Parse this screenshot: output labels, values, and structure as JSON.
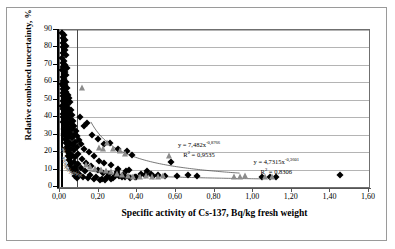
{
  "chart_data": {
    "type": "scatter",
    "title": "",
    "xlabel": "Specific activity of Cs-137, Bq/kg fresh weight",
    "ylabel": "Relative combined uncertainty, %",
    "xlim": [
      0.0,
      1.6
    ],
    "ylim": [
      0,
      90
    ],
    "xticks": [
      "0,00",
      "0,20",
      "0,40",
      "0,60",
      "0,80",
      "1,00",
      "1,20",
      "1,40",
      "1,60"
    ],
    "xtick_values": [
      0.0,
      0.2,
      0.4,
      0.6,
      0.8,
      1.0,
      1.2,
      1.4,
      1.6
    ],
    "yticks": [
      "0",
      "10",
      "20",
      "30",
      "40",
      "50",
      "60",
      "70",
      "80",
      "90"
    ],
    "ytick_values": [
      0,
      10,
      20,
      30,
      40,
      50,
      60,
      70,
      80,
      90
    ],
    "grid": "horizontal-only",
    "legend": "none",
    "reference_lines": [
      {
        "name": "detection-limit-line-1",
        "x": 0.007
      },
      {
        "name": "detection-limit-line-2",
        "x": 0.088
      }
    ],
    "annotations": [
      {
        "name": "trend-equation-upper",
        "equation": "y = 7,482x",
        "exponent": "-0,8766",
        "r2": "R",
        "r2_sup": "2",
        "r2_value": " = 0,9535",
        "x": 0.72,
        "y": 22
      },
      {
        "name": "trend-equation-lower",
        "equation": "y = 4,7315x",
        "exponent": "-0,3601",
        "r2": "R",
        "r2_sup": "2",
        "r2_value": " = 0,8306",
        "x": 1.12,
        "y": 12
      }
    ],
    "trendlines": [
      {
        "name": "power-fit-upper",
        "coefficient": 7.482,
        "exponent": -0.8766,
        "r2": 0.9535,
        "x_start": 0.16,
        "x_end": 0.93
      },
      {
        "name": "power-fit-lower",
        "coefficient": 4.7315,
        "exponent": -0.3601,
        "r2": 0.8306,
        "x_start": 0.1,
        "x_end": 1.05
      }
    ],
    "series": [
      {
        "name": "diamond-series",
        "marker": "diamond",
        "color": "#000000",
        "points": [
          [
            0.012,
            88.5
          ],
          [
            0.021,
            87.0
          ],
          [
            0.015,
            85.5
          ],
          [
            0.028,
            84.0
          ],
          [
            0.018,
            82.5
          ],
          [
            0.033,
            81.0
          ],
          [
            0.013,
            80.0
          ],
          [
            0.024,
            78.5
          ],
          [
            0.016,
            77.0
          ],
          [
            0.03,
            75.5
          ],
          [
            0.011,
            74.0
          ],
          [
            0.022,
            72.5
          ],
          [
            0.014,
            71.0
          ],
          [
            0.027,
            70.0
          ],
          [
            0.017,
            69.0
          ],
          [
            0.036,
            68.0
          ],
          [
            0.01,
            67.0
          ],
          [
            0.025,
            66.0
          ],
          [
            0.019,
            65.0
          ],
          [
            0.032,
            64.0
          ],
          [
            0.013,
            63.0
          ],
          [
            0.023,
            62.0
          ],
          [
            0.016,
            61.0
          ],
          [
            0.029,
            60.0
          ],
          [
            0.012,
            59.0
          ],
          [
            0.026,
            58.5
          ],
          [
            0.018,
            58.0
          ],
          [
            0.035,
            57.0
          ],
          [
            0.014,
            56.0
          ],
          [
            0.021,
            55.0
          ],
          [
            0.031,
            54.5
          ],
          [
            0.017,
            54.0
          ],
          [
            0.04,
            53.0
          ],
          [
            0.024,
            52.5
          ],
          [
            0.013,
            52.0
          ],
          [
            0.046,
            51.0
          ],
          [
            0.02,
            50.5
          ],
          [
            0.033,
            50.0
          ],
          [
            0.015,
            49.5
          ],
          [
            0.028,
            49.0
          ],
          [
            0.052,
            48.5
          ],
          [
            0.019,
            48.0
          ],
          [
            0.038,
            47.0
          ],
          [
            0.012,
            46.5
          ],
          [
            0.03,
            46.0
          ],
          [
            0.044,
            45.5
          ],
          [
            0.022,
            45.0
          ],
          [
            0.016,
            44.5
          ],
          [
            0.056,
            44.0
          ],
          [
            0.034,
            43.5
          ],
          [
            0.025,
            43.0
          ],
          [
            0.048,
            42.5
          ],
          [
            0.018,
            42.0
          ],
          [
            0.04,
            41.5
          ],
          [
            0.062,
            41.0
          ],
          [
            0.027,
            40.5
          ],
          [
            0.014,
            40.0
          ],
          [
            0.036,
            39.5
          ],
          [
            0.051,
            39.0
          ],
          [
            0.021,
            38.5
          ],
          [
            0.068,
            38.0
          ],
          [
            0.031,
            37.5
          ],
          [
            0.017,
            37.0
          ],
          [
            0.043,
            36.5
          ],
          [
            0.058,
            36.0
          ],
          [
            0.14,
            36.5
          ],
          [
            0.024,
            35.5
          ],
          [
            0.075,
            35.0
          ],
          [
            0.035,
            34.5
          ],
          [
            0.049,
            34.0
          ],
          [
            0.019,
            33.5
          ],
          [
            0.064,
            33.0
          ],
          [
            0.028,
            32.5
          ],
          [
            0.082,
            32.0
          ],
          [
            0.041,
            31.5
          ],
          [
            0.054,
            31.0
          ],
          [
            0.022,
            30.5
          ],
          [
            0.07,
            30.0
          ],
          [
            0.033,
            29.5
          ],
          [
            0.09,
            29.0
          ],
          [
            0.046,
            28.5
          ],
          [
            0.06,
            28.0
          ],
          [
            0.025,
            27.5
          ],
          [
            0.1,
            27.0
          ],
          [
            0.038,
            26.5
          ],
          [
            0.076,
            26.0
          ],
          [
            0.051,
            25.5
          ],
          [
            0.029,
            25.0
          ],
          [
            0.11,
            24.5
          ],
          [
            0.065,
            24.0
          ],
          [
            0.043,
            23.5
          ],
          [
            0.088,
            23.0
          ],
          [
            0.032,
            22.5
          ],
          [
            0.125,
            22.0
          ],
          [
            0.057,
            21.5
          ],
          [
            0.072,
            21.0
          ],
          [
            0.036,
            20.5
          ],
          [
            0.15,
            20.0
          ],
          [
            0.048,
            19.5
          ],
          [
            0.095,
            19.0
          ],
          [
            0.063,
            18.5
          ],
          [
            0.04,
            18.0
          ],
          [
            0.175,
            17.5
          ],
          [
            0.08,
            17.0
          ],
          [
            0.054,
            16.5
          ],
          [
            0.115,
            16.0
          ],
          [
            0.045,
            15.5
          ],
          [
            0.2,
            15.0
          ],
          [
            0.07,
            14.5
          ],
          [
            0.135,
            14.0
          ],
          [
            0.058,
            13.5
          ],
          [
            0.095,
            13.0
          ],
          [
            0.23,
            13.5
          ],
          [
            0.05,
            12.5
          ],
          [
            0.16,
            12.0
          ],
          [
            0.078,
            11.5
          ],
          [
            0.265,
            12.5
          ],
          [
            0.11,
            11.0
          ],
          [
            0.062,
            10.5
          ],
          [
            0.195,
            10.0
          ],
          [
            0.085,
            9.5
          ],
          [
            0.3,
            10.5
          ],
          [
            0.13,
            9.0
          ],
          [
            0.07,
            8.5
          ],
          [
            0.225,
            8.0
          ],
          [
            0.1,
            7.5
          ],
          [
            0.34,
            9.0
          ],
          [
            0.155,
            7.0
          ],
          [
            0.078,
            6.5
          ],
          [
            0.255,
            7.5
          ],
          [
            0.12,
            6.0
          ],
          [
            0.375,
            18.5
          ],
          [
            0.185,
            5.5
          ],
          [
            0.09,
            5.0
          ],
          [
            0.285,
            6.5
          ],
          [
            0.145,
            5.0
          ],
          [
            0.215,
            4.8
          ],
          [
            0.32,
            6.0
          ],
          [
            0.175,
            4.5
          ],
          [
            0.245,
            5.5
          ],
          [
            0.355,
            9.5
          ],
          [
            0.205,
            4.2
          ],
          [
            0.275,
            5.0
          ],
          [
            0.39,
            6.0
          ],
          [
            0.235,
            4.0
          ],
          [
            0.305,
            6.5
          ],
          [
            0.42,
            7.5
          ],
          [
            0.265,
            4.5
          ],
          [
            0.335,
            5.5
          ],
          [
            0.45,
            9.0
          ],
          [
            0.295,
            8.5
          ],
          [
            0.365,
            5.0
          ],
          [
            0.48,
            6.5
          ],
          [
            0.325,
            7.0
          ],
          [
            0.395,
            6.0
          ],
          [
            0.51,
            7.0
          ],
          [
            0.44,
            6.8
          ],
          [
            0.545,
            6.5
          ],
          [
            0.47,
            7.2
          ],
          [
            0.575,
            14.5
          ],
          [
            0.605,
            6.5
          ],
          [
            0.665,
            7.0
          ],
          [
            0.71,
            6.5
          ],
          [
            0.26,
            25.5
          ],
          [
            0.23,
            24.5
          ],
          [
            0.3,
            22.0
          ],
          [
            0.345,
            20.5
          ],
          [
            0.165,
            30.0
          ],
          [
            0.195,
            27.5
          ],
          [
            1.045,
            5.8
          ],
          [
            1.085,
            6.0
          ],
          [
            1.12,
            5.5
          ],
          [
            1.45,
            7.0
          ],
          [
            0.125,
            35.0
          ],
          [
            0.105,
            40.0
          ]
        ]
      },
      {
        "name": "triangle-series",
        "marker": "triangle",
        "color": "#8c8c8c",
        "points": [
          [
            0.115,
            56.5
          ],
          [
            0.245,
            25.0
          ],
          [
            0.275,
            22.0
          ],
          [
            0.31,
            20.5
          ],
          [
            0.335,
            19.0
          ],
          [
            0.225,
            21.5
          ],
          [
            0.2,
            22.5
          ],
          [
            0.265,
            8.5
          ],
          [
            0.295,
            7.5
          ],
          [
            0.32,
            7.0
          ],
          [
            0.35,
            6.5
          ],
          [
            0.38,
            6.0
          ],
          [
            0.415,
            5.5
          ],
          [
            0.445,
            6.5
          ],
          [
            0.475,
            6.0
          ],
          [
            0.505,
            5.8
          ],
          [
            0.535,
            6.2
          ],
          [
            0.565,
            18.0
          ],
          [
            0.18,
            10.5
          ],
          [
            0.155,
            11.5
          ],
          [
            0.135,
            12.5
          ],
          [
            0.21,
            9.5
          ],
          [
            0.24,
            9.0
          ],
          [
            0.9,
            6.0
          ],
          [
            0.93,
            5.8
          ],
          [
            0.96,
            6.2
          ],
          [
            1.06,
            5.6
          ],
          [
            1.1,
            5.9
          ]
        ]
      },
      {
        "name": "cross-series",
        "marker": "cross",
        "color": "#7d7d7d",
        "points": [
          [
            0.016,
            22.0
          ],
          [
            0.02,
            20.5
          ],
          [
            0.018,
            16.5
          ],
          [
            0.024,
            15.0
          ],
          [
            0.03,
            11.5
          ],
          [
            0.038,
            10.5
          ],
          [
            0.047,
            9.5
          ],
          [
            0.055,
            8.8
          ],
          [
            0.065,
            8.2
          ],
          [
            0.078,
            7.8
          ],
          [
            0.09,
            7.2
          ],
          [
            0.105,
            6.8
          ],
          [
            0.028,
            13.0
          ],
          [
            0.035,
            12.0
          ]
        ]
      }
    ]
  }
}
